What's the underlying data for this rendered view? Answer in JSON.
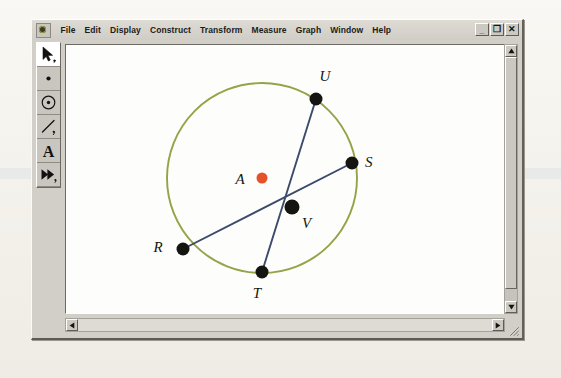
{
  "window": {
    "app_icon": "app-icon",
    "menu_items": [
      "File",
      "Edit",
      "Display",
      "Construct",
      "Transform",
      "Measure",
      "Graph",
      "Window",
      "Help"
    ],
    "controls": {
      "minimize": "_",
      "restore": "❐",
      "close": "✕"
    }
  },
  "toolbox": {
    "tools": [
      {
        "name": "selection-arrow-tool",
        "glyph": "arrow",
        "active": true
      },
      {
        "name": "point-tool",
        "glyph": "point",
        "active": false
      },
      {
        "name": "compass-circle-tool",
        "glyph": "circle",
        "active": false
      },
      {
        "name": "straightedge-tool",
        "glyph": "segment",
        "active": false
      },
      {
        "name": "text-tool",
        "glyph": "A",
        "active": false
      },
      {
        "name": "custom-tool",
        "glyph": "double-arrow",
        "active": false
      }
    ]
  },
  "scrollbars": {
    "vertical": {
      "up": "▲",
      "down": "▼"
    },
    "horizontal": {
      "left": "◀",
      "right": "▶"
    }
  },
  "sketch": {
    "colors": {
      "circle_stroke": "#94a347",
      "chord_stroke": "#3c4a6b",
      "point_fill": "#141410",
      "center_fill": "#e4512a",
      "label_fill": "#16160f",
      "canvas": "#fdfdfb"
    },
    "circle": {
      "label": "A",
      "cx": 196,
      "cy": 133,
      "r": 95
    },
    "points": [
      {
        "label": "A",
        "x": 196,
        "y": 133,
        "r": 5.5,
        "fill": "center",
        "lx": 174,
        "ly": 139
      },
      {
        "label": "U",
        "x": 250,
        "y": 54,
        "r": 6.5,
        "fill": "point",
        "lx": 259,
        "ly": 36
      },
      {
        "label": "S",
        "x": 286,
        "y": 118,
        "r": 6.5,
        "fill": "point",
        "lx": 299,
        "ly": 122
      },
      {
        "label": "V",
        "x": 226,
        "y": 162,
        "r": 7.5,
        "fill": "point",
        "lx": 236,
        "ly": 183
      },
      {
        "label": "R",
        "x": 117,
        "y": 204,
        "r": 6.5,
        "fill": "point",
        "lx": 92,
        "ly": 207
      },
      {
        "label": "T",
        "x": 196,
        "y": 227,
        "r": 6.5,
        "fill": "point",
        "lx": 191,
        "ly": 253
      }
    ],
    "chords": [
      {
        "name": "chord-RS",
        "from": "R",
        "to": "S",
        "x1": 117,
        "y1": 204,
        "x2": 286,
        "y2": 118
      },
      {
        "name": "chord-UT",
        "from": "U",
        "to": "T",
        "x1": 250,
        "y1": 54,
        "x2": 196,
        "y2": 227
      }
    ]
  }
}
